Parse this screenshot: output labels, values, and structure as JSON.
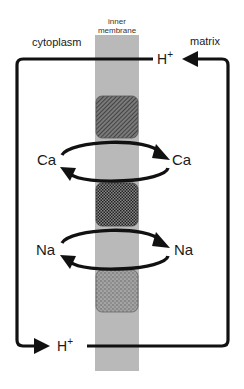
{
  "diagram": {
    "labels": {
      "membrane_line1": "inner",
      "membrane_line2": "membrane",
      "left_region": "cytoplasm",
      "right_region": "matrix"
    },
    "ions": {
      "h_top": "H",
      "h_top_charge": "+",
      "h_bottom": "H",
      "h_bottom_charge": "+",
      "ca_left": "Ca",
      "ca_right": "Ca",
      "na_left": "Na",
      "na_right": "Na"
    },
    "transporters": [
      {
        "name": "top-transporter",
        "pattern": "diagonal-hatch",
        "color": "#5a5a5a"
      },
      {
        "name": "middle-transporter",
        "pattern": "checker",
        "color": "#4a4a4a"
      },
      {
        "name": "bottom-transporter",
        "pattern": "stipple",
        "color": "#8a8a8a"
      }
    ],
    "colors": {
      "membrane": "#b9b9b9",
      "line": "#111111",
      "background": "#ffffff"
    }
  }
}
